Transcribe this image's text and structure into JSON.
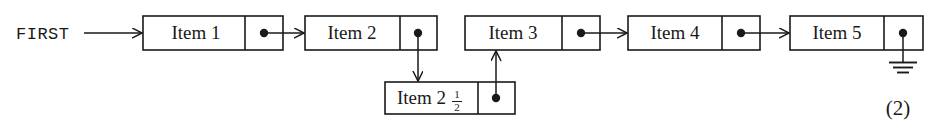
{
  "figure": {
    "caption_number": "(2)",
    "head_pointer_label": "FIRST",
    "colors": {
      "ink": "#1a1a1a",
      "paper": "#ffffff"
    },
    "nodes": [
      {
        "id": "item1",
        "label": "Item 1",
        "pointer_glyph": "•",
        "pointer_kind": "dot",
        "x": 143,
        "y": 16,
        "width": 140,
        "height": 34,
        "divider_x": 245
      },
      {
        "id": "item2",
        "label": "Item 2",
        "pointer_glyph": "•",
        "pointer_kind": "dot",
        "x": 305,
        "y": 16,
        "width": 132,
        "height": 34,
        "divider_x": 400
      },
      {
        "id": "item3",
        "label": "Item 3",
        "pointer_glyph": "•",
        "pointer_kind": "dot",
        "x": 465,
        "y": 16,
        "width": 135,
        "height": 34,
        "divider_x": 562
      },
      {
        "id": "item4",
        "label": "Item 4",
        "pointer_glyph": "•",
        "pointer_kind": "dot",
        "x": 628,
        "y": 16,
        "width": 132,
        "height": 34,
        "divider_x": 722
      },
      {
        "id": "item5",
        "label": "Item 5",
        "pointer_glyph": "•",
        "pointer_kind": "ground",
        "x": 790,
        "y": 16,
        "width": 133,
        "height": 34,
        "divider_x": 884
      },
      {
        "id": "item2half",
        "label": "Item 2",
        "label_fraction_numerator": "1",
        "label_fraction_denominator": "2",
        "pointer_glyph": "•",
        "pointer_kind": "dot",
        "x": 385,
        "y": 82,
        "width": 130,
        "height": 32,
        "divider_x": 478
      }
    ],
    "edges": [
      {
        "id": "first-to-item1",
        "from": "FIRST",
        "to": "item1",
        "direction": "right"
      },
      {
        "id": "item1-to-item2",
        "from": "item1",
        "to": "item2",
        "direction": "right"
      },
      {
        "id": "item2-to-item2half",
        "from": "item2",
        "to": "item2half",
        "direction": "down"
      },
      {
        "id": "item2half-to-item3",
        "from": "item2half",
        "to": "item3",
        "direction": "up"
      },
      {
        "id": "item3-to-item4",
        "from": "item3",
        "to": "item4",
        "direction": "right"
      },
      {
        "id": "item4-to-item5",
        "from": "item4",
        "to": "item5",
        "direction": "right"
      },
      {
        "id": "item5-to-null",
        "from": "item5",
        "to": "null-ground",
        "direction": "down"
      }
    ]
  }
}
